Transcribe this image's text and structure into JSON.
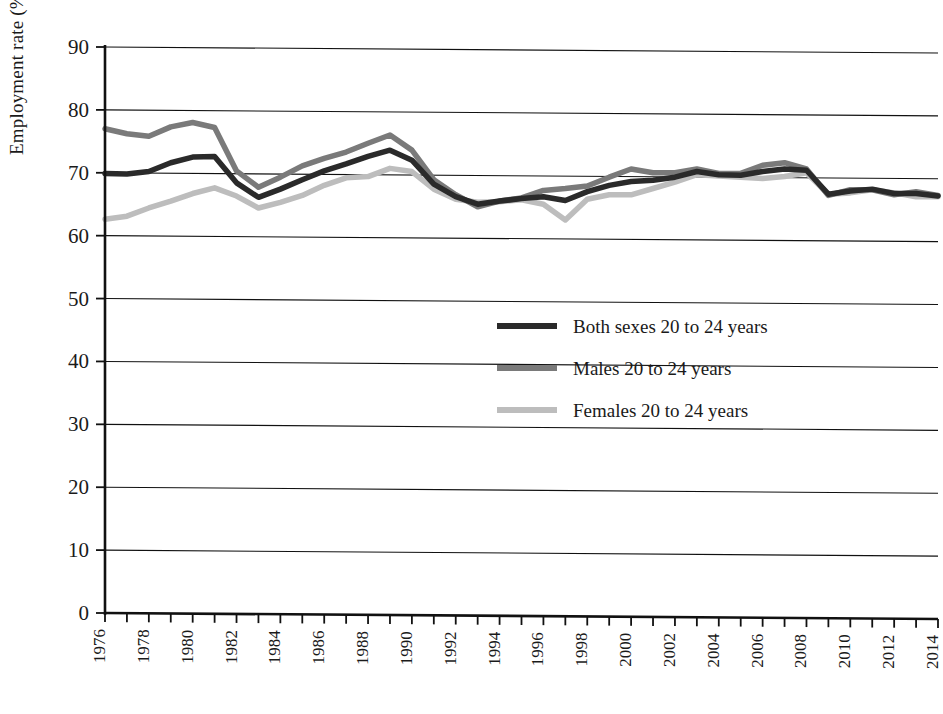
{
  "chart_data": {
    "type": "line",
    "title": "",
    "xlabel": "",
    "ylabel": "Employment rate (%)",
    "ylim": [
      0,
      90
    ],
    "ytick_labels": [
      "0",
      "10",
      "20",
      "30",
      "40",
      "50",
      "60",
      "70",
      "80",
      "90"
    ],
    "ytick_values": [
      0,
      10,
      20,
      30,
      40,
      50,
      60,
      70,
      80,
      90
    ],
    "grid": "horizontal",
    "legend_position": "center",
    "x": [
      1976,
      1977,
      1978,
      1979,
      1980,
      1981,
      1982,
      1983,
      1984,
      1985,
      1986,
      1987,
      1988,
      1989,
      1990,
      1991,
      1992,
      1993,
      1994,
      1995,
      1996,
      1997,
      1998,
      1999,
      2000,
      2001,
      2002,
      2003,
      2004,
      2005,
      2006,
      2007,
      2008,
      2009,
      2010,
      2011,
      2012,
      2013,
      2014
    ],
    "xtick_labels": [
      "1976",
      "1978",
      "1980",
      "1982",
      "1984",
      "1986",
      "1988",
      "1990",
      "1992",
      "1994",
      "1996",
      "1998",
      "2000",
      "2002",
      "2004",
      "2006",
      "2008",
      "2010",
      "2012",
      "2014"
    ],
    "xlim": [
      1976,
      2014
    ],
    "series": [
      {
        "name": "Both sexes 20 to 24 years",
        "color": "#2a2a2a",
        "width": 5.5,
        "values": [
          69.9,
          69.8,
          70.2,
          71.6,
          72.5,
          72.6,
          68.4,
          66.1,
          67.4,
          68.9,
          70.3,
          71.4,
          72.6,
          73.6,
          72.0,
          68.2,
          66.2,
          65.0,
          65.5,
          65.9,
          66.2,
          65.6,
          67.0,
          68.0,
          68.6,
          68.8,
          69.3,
          70.2,
          69.7,
          69.6,
          70.2,
          70.6,
          70.4,
          66.6,
          67.1,
          67.4,
          66.7,
          66.7,
          66.3
        ]
      },
      {
        "name": "Males 20 to 24 years",
        "color": "#7a7a7a",
        "width": 5.5,
        "values": [
          77.0,
          76.2,
          75.8,
          77.3,
          78.0,
          77.2,
          70.3,
          67.7,
          69.3,
          71.1,
          72.3,
          73.3,
          74.7,
          76.0,
          73.6,
          68.9,
          66.5,
          64.6,
          65.5,
          66.0,
          67.2,
          67.5,
          67.9,
          69.3,
          70.6,
          70.0,
          70.0,
          70.6,
          69.9,
          69.9,
          71.2,
          71.6,
          70.6,
          66.4,
          67.3,
          67.3,
          66.5,
          67.0,
          66.4
        ]
      },
      {
        "name": "Females 20 to 24 years",
        "color": "#bdbdbd",
        "width": 5.5,
        "values": [
          62.6,
          63.1,
          64.4,
          65.5,
          66.7,
          67.6,
          66.3,
          64.4,
          65.3,
          66.4,
          68.0,
          69.2,
          69.4,
          70.7,
          70.2,
          67.4,
          65.8,
          65.3,
          65.4,
          65.7,
          65.0,
          62.5,
          65.8,
          66.5,
          66.5,
          67.5,
          68.5,
          69.7,
          69.5,
          69.3,
          69.1,
          69.4,
          70.0,
          66.6,
          66.8,
          67.3,
          66.8,
          66.2,
          66.2
        ]
      }
    ]
  },
  "legend": {
    "items": [
      {
        "label": "Both sexes 20 to 24 years",
        "color": "#2a2a2a"
      },
      {
        "label": "Males 20 to 24 years",
        "color": "#7a7a7a"
      },
      {
        "label": "Females 20 to 24 years",
        "color": "#bdbdbd"
      }
    ]
  },
  "axis": {
    "y_title": "Employment rate (%)"
  }
}
